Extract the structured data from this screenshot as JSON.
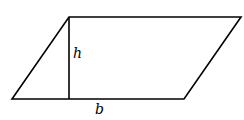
{
  "diagram": {
    "shape": "parallelogram",
    "vertices": {
      "top_left": [
        69,
        17
      ],
      "top_right": [
        241,
        17
      ],
      "bottom_right": [
        184,
        99
      ],
      "bottom_left": [
        12,
        99
      ]
    },
    "height_segment": {
      "from": [
        69,
        17
      ],
      "to": [
        69,
        99
      ]
    },
    "labels": {
      "height": "h",
      "base": "b"
    },
    "stroke_color": "#000000",
    "background": "#ffffff"
  }
}
